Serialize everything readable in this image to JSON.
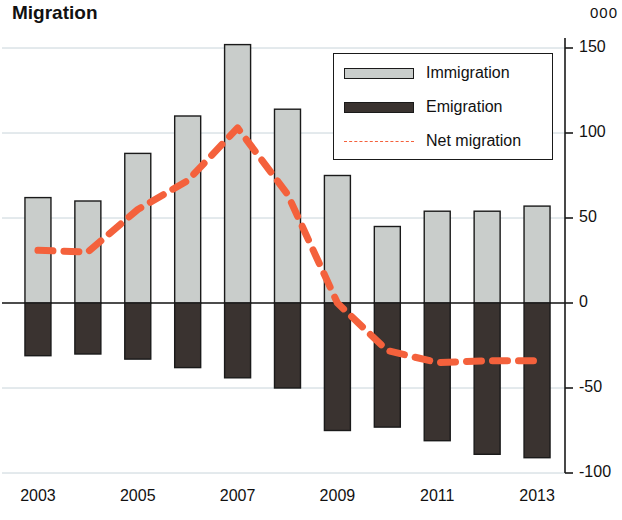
{
  "chart_data": {
    "type": "bar",
    "title": "Migration",
    "unit_label": "000",
    "xlabel": "",
    "ylabel": "",
    "ylim": [
      -100,
      150
    ],
    "yticks": [
      150,
      100,
      50,
      0,
      -50,
      -100
    ],
    "ytick_labels": [
      "150",
      "100",
      "50",
      "0",
      "-50",
      "-100"
    ],
    "grid": true,
    "legend_position": "top-right",
    "categories": [
      2003,
      2004,
      2005,
      2006,
      2007,
      2008,
      2009,
      2010,
      2011,
      2012,
      2013
    ],
    "xtick_labels": [
      "2003",
      "2005",
      "2007",
      "2009",
      "2011",
      "2013"
    ],
    "xticks_shown": [
      2003,
      2005,
      2007,
      2009,
      2011,
      2013
    ],
    "series": [
      {
        "name": "Immigration",
        "type": "bar",
        "color": "#c9cdcb",
        "values": [
          62,
          60,
          88,
          110,
          152,
          114,
          75,
          45,
          54,
          54,
          57
        ]
      },
      {
        "name": "Emigration",
        "type": "bar",
        "color": "#3a3330",
        "values": [
          -31,
          -30,
          -33,
          -38,
          -44,
          -50,
          -75,
          -73,
          -81,
          -89,
          -91
        ]
      },
      {
        "name": "Net migration",
        "type": "line",
        "color": "#f4613c",
        "style": "dashed",
        "values": [
          31,
          30,
          55,
          72,
          103,
          64,
          0,
          -28,
          -35,
          -34,
          -34
        ]
      }
    ]
  },
  "legend": {
    "items": [
      {
        "label": "Immigration",
        "kind": "bar",
        "color": "#c9cdcb"
      },
      {
        "label": "Emigration",
        "kind": "bar",
        "color": "#3a3330"
      },
      {
        "label": "Net migration",
        "kind": "line",
        "color": "#f4613c"
      }
    ]
  }
}
